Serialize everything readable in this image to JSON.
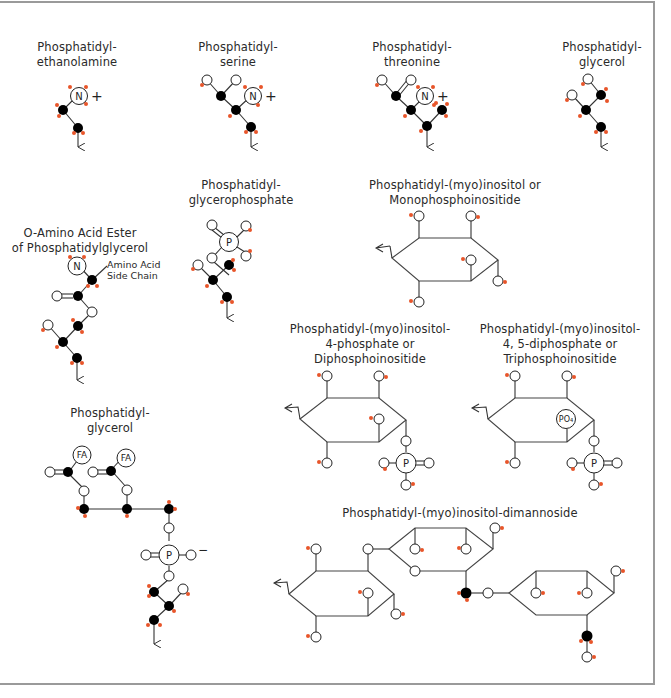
{
  "colors": {
    "carbon": "#000000",
    "oxygen_fill": "#ffffff",
    "hydrogen": "#e8552a",
    "bond": "#333333",
    "frame": "#9a9a9a"
  },
  "structures": [
    {
      "id": "pe",
      "label": "Phosphatidyl-\nethanolamine",
      "atoms": [
        "N"
      ],
      "charge": "+"
    },
    {
      "id": "ps",
      "label": "Phosphatidyl-\nserine",
      "atoms": [
        "N"
      ],
      "charge": "+"
    },
    {
      "id": "pt",
      "label": "Phosphatidyl-\nthreonine",
      "atoms": [
        "N"
      ],
      "charge": "+"
    },
    {
      "id": "pg1",
      "label": "Phosphatidyl-\nglycerol"
    },
    {
      "id": "pgp",
      "label": "Phosphatidyl-\nglycerophosphate",
      "atoms": [
        "P"
      ]
    },
    {
      "id": "pi",
      "label": "Phosphatidyl-(myo)inositol or\nMonophosphoinositide"
    },
    {
      "id": "aaes",
      "label": "O-Amino Acid Ester\nof Phosphatidylglycerol",
      "atoms": [
        "N"
      ],
      "annotation": "Amino Acid\nSide Chain"
    },
    {
      "id": "pip",
      "label": "Phosphatidyl-(myo)inositol-\n4-phosphate or\nDiphosphoinositide",
      "atoms": [
        "P"
      ]
    },
    {
      "id": "pip2",
      "label": "Phosphatidyl-(myo)inositol-\n4, 5-diphosphate or\nTriphosphoinositide",
      "atoms": [
        "PO4",
        "P"
      ]
    },
    {
      "id": "pg2",
      "label": "Phosphatidyl-\nglycerol",
      "atoms": [
        "FA",
        "FA",
        "P"
      ],
      "charge": "−"
    },
    {
      "id": "pim2",
      "label": "Phosphatidyl-(myo)inositol-dimannoside"
    }
  ],
  "atom_labels": {
    "N": "N",
    "P": "P",
    "FA": "FA",
    "PO4": "PO4",
    "plus": "+",
    "minus": "−"
  }
}
